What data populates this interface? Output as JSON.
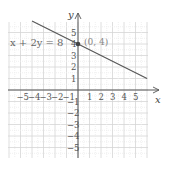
{
  "chart_data": {
    "type": "line",
    "title": "",
    "xlabel": "x",
    "ylabel": "y",
    "xlim": [
      -5.8,
      6
    ],
    "ylim": [
      -5.8,
      6
    ],
    "grid": true,
    "x_ticks": [
      "-5",
      "-4",
      "-3",
      "-2",
      "-1",
      "1",
      "2",
      "3",
      "4",
      "5"
    ],
    "y_ticks": [
      "5",
      "4",
      "3",
      "2",
      "1",
      "-1",
      "-2",
      "-3",
      "-4",
      "-5"
    ],
    "series": [
      {
        "name": "x + 2y = 8",
        "equation": "x + 2y = 8",
        "x": [
          -4,
          6
        ],
        "y": [
          6,
          1
        ],
        "color": "#555555"
      }
    ],
    "annotations": [
      {
        "label": "x + 2y = 8",
        "position": "upper-left"
      },
      {
        "label": "(0, 4)",
        "x": 0,
        "y": 4,
        "marker": "dot"
      }
    ]
  },
  "labels": {
    "equation": "x + 2y = 8",
    "point": "(0, 4)",
    "x_axis": "x",
    "y_axis": "y"
  }
}
